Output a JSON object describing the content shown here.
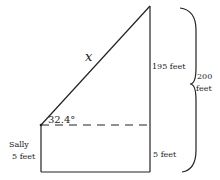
{
  "diagram": {
    "hypotenuse_label": "x",
    "angle_label": "32.4°",
    "height_upper_label": "195 feet",
    "height_lower_label": "5 feet",
    "person_name": "Sally",
    "person_height": "5 feet",
    "total_label_line1": "200",
    "total_label_line2": "feet",
    "stroke_color": "#222222"
  }
}
